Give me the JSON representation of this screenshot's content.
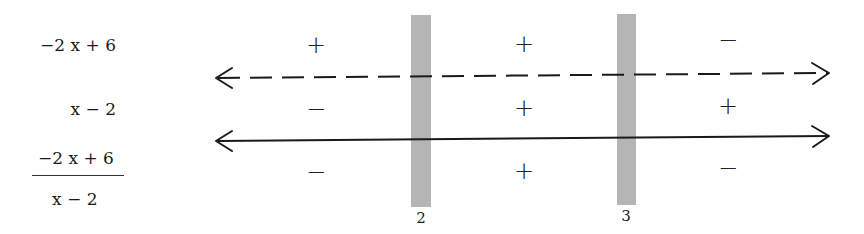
{
  "rows": [
    {
      "label": "−2 x + 6",
      "signs": [
        "+",
        "+",
        "−"
      ],
      "line_style": "dashed"
    },
    {
      "label": "x − 2",
      "signs": [
        "−",
        "+",
        "+"
      ],
      "line_style": "solid"
    },
    {
      "label_numerator": "−2 x + 6",
      "label_denominator": "x − 2",
      "signs": [
        "−",
        "+",
        "−"
      ]
    }
  ],
  "critical_points": [
    {
      "value": "2"
    },
    {
      "value": "3"
    }
  ],
  "colors": {
    "critical_bar": "#b5b5b5",
    "line": "#1a1a1a"
  }
}
